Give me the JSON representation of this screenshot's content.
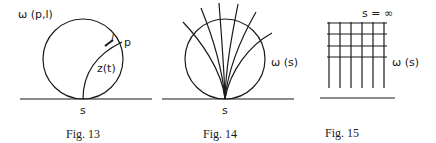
{
  "figures": [
    {
      "caption": "Fig. 13",
      "labels": {
        "omega": "ω (p,l)",
        "point_p": "p",
        "length_l": "l",
        "curve": "z(t)",
        "base_point": "s"
      }
    },
    {
      "caption": "Fig. 14",
      "labels": {
        "omega": "ω (s)",
        "base_point": "s"
      }
    },
    {
      "caption": "Fig. 15",
      "labels": {
        "omega": "ω (s)",
        "infinity": "s = ∞"
      }
    }
  ],
  "colors": {
    "ink": "#1a1a1a",
    "background": "#ffffff"
  }
}
